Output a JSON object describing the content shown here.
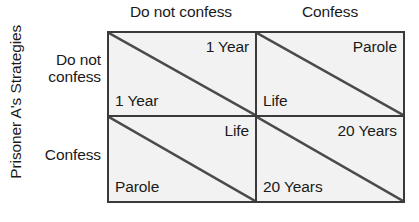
{
  "figure": {
    "axis_title_y": "Prisoner A's Strategies",
    "columns": [
      {
        "label": "Do not confess"
      },
      {
        "label": "Confess"
      }
    ],
    "rows": [
      {
        "label": "Do not\nconfess",
        "label_line1": "Do not",
        "label_line2": "confess"
      },
      {
        "label": "Confess",
        "label_line1": "Confess",
        "label_line2": ""
      }
    ],
    "cells": [
      [
        {
          "top_right": "1 Year",
          "bottom_left": "1 Year"
        },
        {
          "top_right": "Parole",
          "bottom_left": "Life"
        }
      ],
      [
        {
          "top_right": "Life",
          "bottom_left": "Parole"
        },
        {
          "top_right": "20 Years",
          "bottom_left": "20 Years"
        }
      ]
    ],
    "colors": {
      "cell_fill": "#f2f2f2",
      "border": "#3a3a3a",
      "diagonal": "#4a4a4a",
      "text": "#1a1a1a",
      "background": "#ffffff"
    }
  }
}
